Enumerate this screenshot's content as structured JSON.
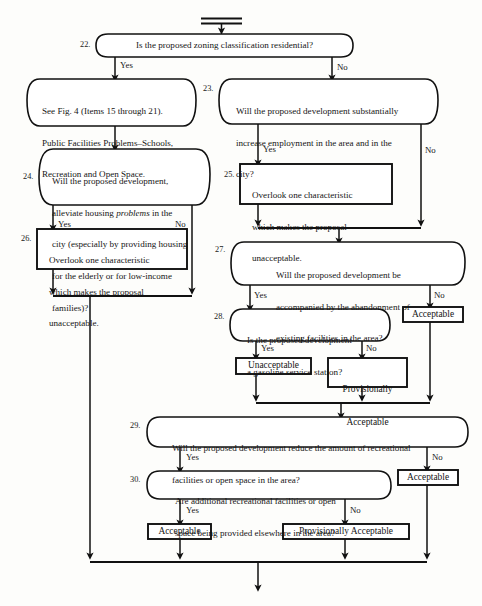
{
  "figure": {
    "type": "decision-flowchart",
    "orientation": "top-to-bottom",
    "entry_symbol": "double-bar-connector",
    "exit_symbol": "down-arrow"
  },
  "nodes": [
    {
      "id": "n22",
      "number": "22.",
      "shape": "rounded-decision",
      "text": "Is the proposed zoning classification residential?",
      "align": "center"
    },
    {
      "id": "n22yes",
      "number": "",
      "shape": "rounded-process",
      "text": "See Fig. 4 (Items 15 through 21).\nPublic Facilities Problems–Schools,\nRecreation and Open Space.",
      "align": "left"
    },
    {
      "id": "n23",
      "number": "23.",
      "shape": "rounded-decision",
      "text": "Will the proposed development substantially\nincrease employment in the area and in the\ncity?",
      "align": "left"
    },
    {
      "id": "n24",
      "number": "24.",
      "shape": "rounded-decision",
      "text": "Will the proposed development,\nalleviate housing problems in the\ncity (especially by providing housing\nfor the elderly or for low-income\nfamilies)?",
      "align": "left",
      "italic_word": "problems"
    },
    {
      "id": "n25",
      "number": "25.",
      "shape": "rect",
      "text": "Overlook one characteristic\nwhich makes the proposal\nunacceptable.",
      "align": "left"
    },
    {
      "id": "n26",
      "number": "26.",
      "shape": "rect",
      "text": "Overlook one characteristic\nwhich makes the proposal\nunacceptable.",
      "align": "left"
    },
    {
      "id": "n27",
      "number": "27.",
      "shape": "rounded-decision",
      "text": "Will the proposed development be\naccompanied by the abandonment of\nexisting facilities in the area?",
      "align": "left"
    },
    {
      "id": "n28",
      "number": "28.",
      "shape": "rounded-decision",
      "text": "Is the proposed development\na gasoline service station?",
      "align": "left"
    },
    {
      "id": "n27no",
      "number": "",
      "shape": "rect",
      "text": "Acceptable",
      "align": "center"
    },
    {
      "id": "n28yes",
      "number": "",
      "shape": "rect",
      "text": "Unacceptable",
      "align": "center"
    },
    {
      "id": "n28no",
      "number": "",
      "shape": "rect",
      "text": "Provisionally\nAcceptable",
      "align": "center"
    },
    {
      "id": "n29",
      "number": "29.",
      "shape": "rounded-decision",
      "text": "Will the proposed development reduce the amount of recreational\nfacilities or open space in the area?",
      "align": "left"
    },
    {
      "id": "n29no",
      "number": "",
      "shape": "rect",
      "text": "Acceptable",
      "align": "center"
    },
    {
      "id": "n30",
      "number": "30.",
      "shape": "rounded-decision",
      "text": "Are additional recreational facilities or open\nspace being provided elsewhere in the area?",
      "align": "left"
    },
    {
      "id": "n30yes",
      "number": "",
      "shape": "rect",
      "text": "Acceptable",
      "align": "center"
    },
    {
      "id": "n30no",
      "number": "",
      "shape": "rect",
      "text": "Provisionally Acceptable",
      "align": "center"
    }
  ],
  "edge_labels": {
    "e22_yes": "Yes",
    "e22_no": "No",
    "e23_yes": "Yes",
    "e23_no": "No",
    "e24_yes": "Yes",
    "e24_no": "No",
    "e27_yes": "Yes",
    "e27_no": "No",
    "e28_yes": "Yes",
    "e28_no": "No",
    "e29_yes": "Yes",
    "e29_no": "No",
    "e30_yes": "Yes",
    "e30_no": "No"
  },
  "numbers": {
    "n22": "22.",
    "n23": "23.",
    "n24": "24.",
    "n25": "25.",
    "n26": "26.",
    "n27": "27.",
    "n28": "28.",
    "n29": "29.",
    "n30": "30."
  },
  "texts": {
    "n22": "Is the proposed zoning classification residential?",
    "n22yes_l1": "See Fig. 4 (Items 15 through 21).",
    "n22yes_l2": "Public Facilities Problems–Schools,",
    "n22yes_l3": "Recreation and Open Space.",
    "n23_l1": "Will the proposed development substantially",
    "n23_l2": "increase employment in the area and in the",
    "n23_l3": "city?",
    "n24_l1": "Will the proposed development,",
    "n24_l2a": "alleviate housing ",
    "n24_l2b": "problems",
    "n24_l2c": " in the",
    "n24_l3": "city (especially by providing housing",
    "n24_l4": "for the elderly or for low-income",
    "n24_l5": "families)?",
    "n25_l1": "Overlook one characteristic",
    "n25_l2": "which makes the proposal",
    "n25_l3": "unacceptable.",
    "n26_l1": "Overlook one characteristic",
    "n26_l2": "which makes the proposal",
    "n26_l3": "unacceptable.",
    "n27_l1": "Will the proposed development be",
    "n27_l2": "accompanied by the abandonment of",
    "n27_l3": "existing facilities in the area?",
    "n28_l1": "Is the proposed development",
    "n28_l2": "a gasoline service station?",
    "n27no": "Acceptable",
    "n28yes": "Unacceptable",
    "n28no_l1": "Provisionally",
    "n28no_l2": "Acceptable",
    "n29_l1": "Will the proposed development reduce the amount of recreational",
    "n29_l2": "facilities or open space in the area?",
    "n29no": "Acceptable",
    "n30_l1": "Are additional recreational facilities or open",
    "n30_l2": "space being provided elsewhere in the area?",
    "n30yes": "Acceptable",
    "n30no": "Provisionally Acceptable"
  },
  "colors": {
    "stroke": "#111111",
    "fill": "#ffffff",
    "background": "#fdfdfb",
    "text": "#151515"
  }
}
